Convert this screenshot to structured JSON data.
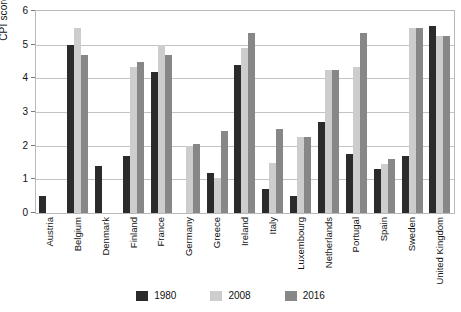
{
  "chart_data": {
    "type": "bar",
    "title": "",
    "xlabel": "",
    "ylabel": "CPI score",
    "ylim": [
      0,
      6
    ],
    "yticks": [
      "0",
      "1",
      "2",
      "3",
      "4",
      "5",
      "6"
    ],
    "grid": true,
    "legend_position": "bottom",
    "categories": [
      "Austria",
      "Belgium",
      "Denmark",
      "Finland",
      "France",
      "Germany",
      "Greece",
      "Ireland",
      "Italy",
      "Luxembourg",
      "Netherlands",
      "Portugal",
      "Spain",
      "Sweden",
      "United Kingdom"
    ],
    "series": [
      {
        "name": "1980",
        "color": "#2b2b2b",
        "values": [
          0.5,
          5.0,
          1.4,
          1.7,
          4.2,
          null,
          1.2,
          4.4,
          0.7,
          0.5,
          2.7,
          1.75,
          1.3,
          1.7,
          5.55
        ]
      },
      {
        "name": "2008",
        "color": "#cdcdcd",
        "values": [
          null,
          5.5,
          null,
          4.35,
          5.0,
          2.0,
          1.05,
          4.9,
          1.5,
          2.25,
          4.25,
          4.35,
          1.45,
          5.5,
          5.25
        ]
      },
      {
        "name": "2016",
        "color": "#878787",
        "values": [
          null,
          4.7,
          null,
          4.5,
          4.7,
          2.05,
          2.45,
          5.35,
          2.5,
          2.25,
          4.25,
          5.35,
          1.6,
          5.5,
          5.25
        ]
      }
    ]
  },
  "axis": {
    "y_title": "CPI score"
  },
  "legend": {
    "items": [
      {
        "label": "1980",
        "color": "#2b2b2b"
      },
      {
        "label": "2008",
        "color": "#cdcdcd"
      },
      {
        "label": "2016",
        "color": "#878787"
      }
    ]
  }
}
